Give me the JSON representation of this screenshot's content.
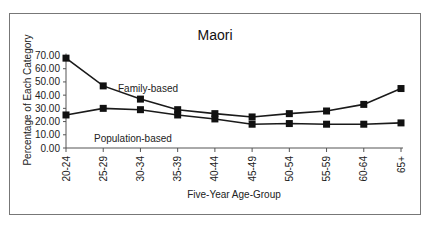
{
  "chart_data": {
    "type": "line",
    "title": "Maori",
    "xlabel": "Five-Year Age-Group",
    "ylabel": "Percentage of Each Category",
    "ylim": [
      0,
      70
    ],
    "yticks": [
      "0.00",
      "10.00",
      "20.00",
      "30.00",
      "40.00",
      "50.00",
      "60.00",
      "70.00"
    ],
    "categories": [
      "20-24",
      "25-29",
      "30-34",
      "35-39",
      "40-44",
      "45-49",
      "50-54",
      "55-59",
      "60-64",
      "65+"
    ],
    "series": [
      {
        "name": "Family-based",
        "values": [
          68,
          47,
          37,
          29,
          26,
          23.5,
          26,
          28,
          33,
          45
        ]
      },
      {
        "name": "Population-based",
        "values": [
          25,
          30,
          29,
          25,
          22,
          18,
          18.5,
          18,
          18,
          19
        ]
      }
    ],
    "annotations": [
      {
        "text": "Family-based",
        "series": "Family-based"
      },
      {
        "text": "Population-based",
        "series": "Population-based"
      }
    ],
    "grid": false,
    "legend": "inline annotations",
    "marker": "square",
    "line_color": "#1a1a1a"
  }
}
